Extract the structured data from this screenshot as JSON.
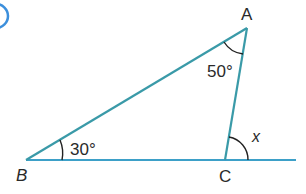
{
  "figure": {
    "vertices": {
      "A": {
        "label": "A",
        "x": 247,
        "y": 28
      },
      "B": {
        "label": "B",
        "x": 26,
        "y": 160
      },
      "C": {
        "label": "C",
        "x": 225,
        "y": 160
      }
    },
    "baseline_end_x": 296,
    "angles": {
      "angle_A": "50°",
      "angle_B": "30°",
      "angle_x": "x"
    },
    "colors": {
      "line": "#3a9aa8",
      "baseline": "#3da0c8",
      "arc": "#222222",
      "corner_circle": "#3c8fdc"
    }
  }
}
